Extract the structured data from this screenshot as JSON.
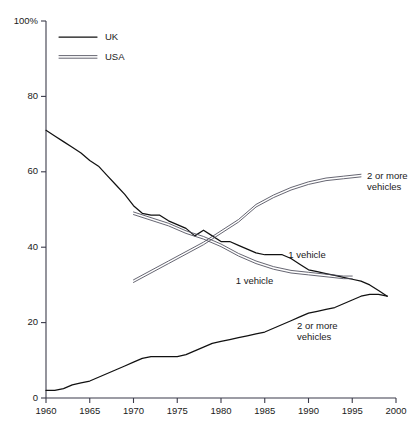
{
  "chart_data": {
    "type": "line",
    "title": "",
    "xlabel": "",
    "ylabel": "",
    "xlim": [
      1960,
      2000
    ],
    "ylim": [
      0,
      100
    ],
    "grid": false,
    "x_ticks": [
      "1960",
      "1965",
      "1970",
      "1975",
      "1980",
      "1985",
      "1990",
      "1995",
      "2000"
    ],
    "y_ticks": [
      "0",
      "20",
      "40",
      "60",
      "80",
      "100%"
    ],
    "legend": {
      "position": "top-left-inside",
      "entries": [
        {
          "name": "UK",
          "style": "single-line"
        },
        {
          "name": "USA",
          "style": "double-line"
        }
      ]
    },
    "annotations": [
      {
        "text": "2 or more vehicles",
        "series": "USA 2 or more vehicles",
        "x": 1996,
        "y": 59
      },
      {
        "text": "1 vehicle",
        "series": "UK 1 vehicle",
        "x": 1987,
        "y": 38
      },
      {
        "text": "1 vehicle",
        "series": "USA 1 vehicle",
        "x": 1981,
        "y": 31
      },
      {
        "text": "2 or more vehicles",
        "series": "UK 2 or more vehicles",
        "x": 1988,
        "y": 19
      }
    ],
    "series": [
      {
        "name": "UK 1 vehicle",
        "country": "UK",
        "category": "1 vehicle",
        "style": "single-line",
        "x": [
          1960,
          1961,
          1962,
          1963,
          1964,
          1965,
          1966,
          1967,
          1968,
          1969,
          1970,
          1971,
          1972,
          1973,
          1974,
          1975,
          1976,
          1977,
          1978,
          1979,
          1980,
          1981,
          1982,
          1983,
          1984,
          1985,
          1986,
          1987,
          1988,
          1989,
          1990,
          1991,
          1992,
          1993,
          1994,
          1995,
          1996,
          1997,
          1998,
          1999
        ],
        "values": [
          71,
          69.5,
          68,
          66.5,
          65,
          63,
          61.5,
          59,
          56.5,
          54,
          51,
          49,
          48.5,
          48.5,
          47,
          46,
          45,
          43,
          44.5,
          43,
          41.5,
          41.5,
          40.5,
          39.5,
          38.5,
          38,
          38,
          38,
          37,
          35.5,
          34,
          33.5,
          33,
          32.5,
          32,
          31.5,
          31,
          30,
          28.5,
          27
        ]
      },
      {
        "name": "UK 2 or more vehicles",
        "country": "UK",
        "category": "2 or more vehicles",
        "style": "single-line",
        "x": [
          1960,
          1961,
          1962,
          1963,
          1964,
          1965,
          1966,
          1967,
          1968,
          1969,
          1970,
          1971,
          1972,
          1973,
          1974,
          1975,
          1976,
          1977,
          1978,
          1979,
          1980,
          1981,
          1982,
          1983,
          1984,
          1985,
          1986,
          1987,
          1988,
          1989,
          1990,
          1991,
          1992,
          1993,
          1994,
          1995,
          1996,
          1997,
          1998,
          1999
        ],
        "values": [
          2,
          2,
          2.5,
          3.5,
          4,
          4.5,
          5.5,
          6.5,
          7.5,
          8.5,
          9.5,
          10.5,
          11,
          11,
          11,
          11,
          11.5,
          12.5,
          13.5,
          14.5,
          15,
          15.5,
          16,
          16.5,
          17,
          17.5,
          18.5,
          19.5,
          20.5,
          21.5,
          22.5,
          23,
          23.5,
          24,
          25,
          26,
          27,
          27.5,
          27.5,
          27
        ]
      },
      {
        "name": "USA 1 vehicle",
        "country": "USA",
        "category": "1 vehicle",
        "style": "double-line",
        "x": [
          1970,
          1972,
          1974,
          1976,
          1978,
          1980,
          1982,
          1984,
          1986,
          1988,
          1990,
          1992,
          1994,
          1995
        ],
        "values": [
          49,
          47.5,
          46,
          44,
          42.5,
          40.5,
          38,
          36,
          34.5,
          33.5,
          33,
          32.5,
          32,
          32
        ]
      },
      {
        "name": "USA 2 or more vehicles",
        "country": "USA",
        "category": "2 or more vehicles",
        "style": "double-line",
        "x": [
          1970,
          1972,
          1974,
          1976,
          1978,
          1980,
          1982,
          1984,
          1986,
          1988,
          1990,
          1992,
          1994,
          1996
        ],
        "values": [
          31,
          33.5,
          36,
          38.5,
          41,
          44,
          47,
          51,
          53.5,
          55.5,
          57,
          58,
          58.5,
          59
        ]
      }
    ]
  }
}
